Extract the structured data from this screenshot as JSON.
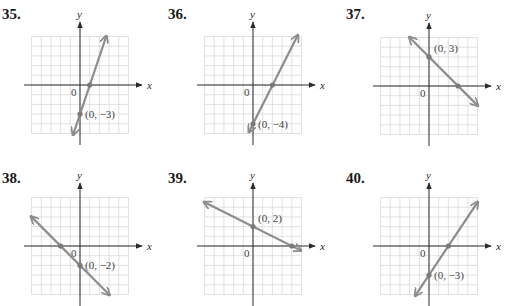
{
  "colors": {
    "grid": "#d9d9d9",
    "axis": "#2a2a2a",
    "line": "#8c8c8c",
    "point": "#7a7a7a",
    "label": "#444444"
  },
  "axis_labels": {
    "x": "x",
    "y": "y",
    "origin": "0"
  },
  "problems": [
    {
      "number": "35.",
      "point_label": "(0, −3)"
    },
    {
      "number": "36.",
      "point_label": "(0, −4)"
    },
    {
      "number": "37.",
      "point_label": "(0, 3)"
    },
    {
      "number": "38.",
      "point_label": "(0, −2)"
    },
    {
      "number": "39.",
      "point_label": "(0, 2)"
    },
    {
      "number": "40.",
      "point_label": "(0, −3)"
    }
  ],
  "chart_data": [
    {
      "type": "line",
      "title": "35.",
      "xlabel": "x",
      "ylabel": "y",
      "xlim": [
        -5,
        5
      ],
      "ylim": [
        -5,
        5
      ],
      "grid": true,
      "line": {
        "from": [
          -0.7,
          -5.1
        ],
        "to": [
          2.7,
          5.0
        ]
      },
      "points": [
        [
          0,
          -3
        ],
        [
          1,
          0
        ]
      ],
      "annotation": "(0, −3)",
      "equation_implied": "y = 3x − 3"
    },
    {
      "type": "line",
      "title": "36.",
      "xlabel": "x",
      "ylabel": "y",
      "xlim": [
        -5,
        5
      ],
      "ylim": [
        -5,
        5
      ],
      "grid": true,
      "line": {
        "from": [
          -0.4,
          -4.8
        ],
        "to": [
          4.6,
          5.1
        ]
      },
      "points": [
        [
          0,
          -4
        ],
        [
          2,
          0
        ]
      ],
      "annotation": "(0, −4)",
      "equation_implied": "y = 2x − 4"
    },
    {
      "type": "line",
      "title": "37.",
      "xlabel": "x",
      "ylabel": "y",
      "xlim": [
        -5,
        5
      ],
      "ylim": [
        -5,
        5
      ],
      "grid": true,
      "line": {
        "from": [
          -2.0,
          5.0
        ],
        "to": [
          5.0,
          -2.0
        ]
      },
      "points": [
        [
          0,
          3
        ],
        [
          3,
          0
        ]
      ],
      "annotation": "(0, 3)",
      "equation_implied": "y = −x + 3"
    },
    {
      "type": "line",
      "title": "38.",
      "xlabel": "x",
      "ylabel": "y",
      "xlim": [
        -5,
        5
      ],
      "ylim": [
        -5,
        5
      ],
      "grid": true,
      "line": {
        "from": [
          -5.0,
          3.0
        ],
        "to": [
          3.0,
          -5.0
        ]
      },
      "points": [
        [
          0,
          -2
        ],
        [
          -2,
          0
        ]
      ],
      "annotation": "(0, −2)",
      "equation_implied": "y = −x − 2"
    },
    {
      "type": "line",
      "title": "39.",
      "xlabel": "x",
      "ylabel": "y",
      "xlim": [
        -5,
        5
      ],
      "ylim": [
        -5,
        5
      ],
      "grid": true,
      "line": {
        "from": [
          -5.0,
          4.5
        ],
        "to": [
          4.9,
          -0.45
        ]
      },
      "points": [
        [
          0,
          2
        ],
        [
          4,
          0
        ]
      ],
      "annotation": "(0, 2)",
      "equation_implied": "y = −x/2 + 2"
    },
    {
      "type": "line",
      "title": "40.",
      "xlabel": "x",
      "ylabel": "y",
      "xlim": [
        -5,
        5
      ],
      "ylim": [
        -5,
        5
      ],
      "grid": true,
      "line": {
        "from": [
          -1.4,
          -5.1
        ],
        "to": [
          5.0,
          4.5
        ]
      },
      "points": [
        [
          0,
          -3
        ],
        [
          2,
          0
        ]
      ],
      "annotation": "(0, −3)",
      "equation_implied": "y = 3x/2 − 3"
    }
  ]
}
